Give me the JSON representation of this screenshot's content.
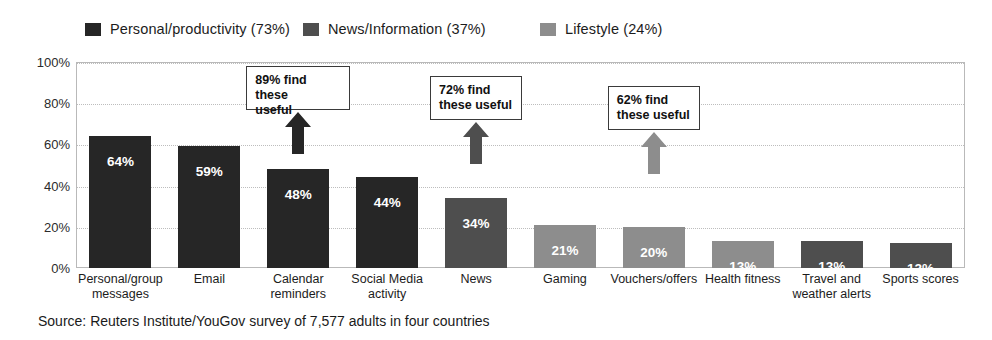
{
  "chart_data": {
    "type": "bar",
    "title": "",
    "xlabel": "",
    "ylabel": "",
    "ylim": [
      0,
      100
    ],
    "ytick_labels": [
      "100%",
      "80%",
      "60%",
      "40%",
      "20%",
      "0%"
    ],
    "ytick_values": [
      100,
      80,
      60,
      40,
      20,
      0
    ],
    "grid": true,
    "legend_position": "top",
    "categories": [
      "Personal/group messages",
      "Email",
      "Calendar reminders",
      "Social Media activity",
      "News",
      "Gaming",
      "Vouchers/offers",
      "Health fitness",
      "Travel and weather alerts",
      "Sports scores"
    ],
    "values": [
      64,
      59,
      48,
      44,
      34,
      21,
      20,
      13,
      13,
      12
    ],
    "value_labels": [
      "64%",
      "59%",
      "48%",
      "44%",
      "34%",
      "21%",
      "20%",
      "13%",
      "13%",
      "12%"
    ],
    "bar_groups": [
      "personal",
      "personal",
      "personal",
      "personal",
      "news",
      "lifestyle",
      "lifestyle",
      "lifestyle",
      "news",
      "news"
    ],
    "legend": [
      {
        "label": "Personal/productivity (73%)",
        "color": "#262626",
        "key": "personal"
      },
      {
        "label": "News/Information (37%)",
        "color": "#4e4e4e",
        "key": "news"
      },
      {
        "label": "Lifestyle (24%)",
        "color": "#8d8d8d",
        "key": "lifestyle"
      }
    ],
    "annotations": [
      {
        "text": "89% find these useful",
        "target_category": "Calendar reminders",
        "color": "#262626"
      },
      {
        "text": "72% find these useful",
        "target_category": "News",
        "color": "#4e4e4e"
      },
      {
        "text": "62% find these useful",
        "target_category": "Vouchers/offers",
        "color": "#8d8d8d"
      }
    ],
    "source": "Source: Reuters Institute/YouGov survey of 7,577 adults in four countries"
  },
  "legend": {
    "items": [
      {
        "label": "Personal/productivity (73%)"
      },
      {
        "label": "News/Information (37%)"
      },
      {
        "label": "Lifestyle (24%)"
      }
    ]
  },
  "axis": {
    "y_labels": [
      "100%",
      "80%",
      "60%",
      "40%",
      "20%",
      "0%"
    ]
  },
  "callouts": [
    {
      "line1": "89% find these",
      "line2": "useful"
    },
    {
      "line1": "72% find",
      "line2": "these useful"
    },
    {
      "line1": "62% find",
      "line2": "these useful"
    }
  ],
  "footer": {
    "source": "Source: Reuters Institute/YouGov survey of 7,577 adults in four countries"
  },
  "colors": {
    "personal": "#262626",
    "news": "#4e4e4e",
    "lifestyle": "#8d8d8d",
    "grid": "#bdbdbd",
    "frame": "#b9b9b9",
    "text": "#1a1a1a"
  }
}
